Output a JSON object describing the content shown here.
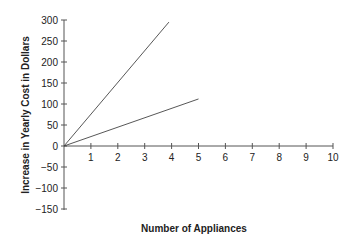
{
  "chart_data": {
    "type": "line",
    "title": "",
    "xlabel": "Number of Appliances",
    "ylabel": "Increase in Yearly Cost in Dollars",
    "xlim": [
      0,
      10
    ],
    "ylim": [
      -150,
      300
    ],
    "x_ticks": [
      "1",
      "2",
      "3",
      "4",
      "5",
      "6",
      "7",
      "8",
      "9",
      "10"
    ],
    "y_ticks": [
      "300",
      "250",
      "200",
      "150",
      "100",
      "50",
      "0",
      "−50",
      "−100",
      "−150"
    ],
    "grid": false,
    "legend": null,
    "series": [
      {
        "name": "steep line",
        "points": [
          [
            0,
            0
          ],
          [
            3.9,
            295
          ]
        ]
      },
      {
        "name": "shallow line",
        "points": [
          [
            0,
            0
          ],
          [
            5,
            112
          ]
        ]
      }
    ]
  }
}
